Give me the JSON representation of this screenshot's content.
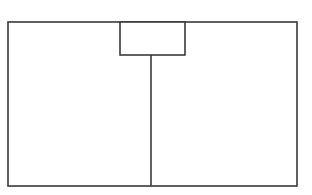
{
  "diagram": {
    "type": "floor-plan-outline",
    "canvas": {
      "width": 312,
      "height": 195,
      "background": "#ffffff"
    },
    "stroke": {
      "color": "#3a3a3a",
      "width": 1.6
    },
    "outer_rect": {
      "x": 8,
      "y": 22,
      "width": 289,
      "height": 164
    },
    "top_box": {
      "x": 120,
      "y": 22,
      "width": 65,
      "height": 33
    },
    "divider": {
      "x": 151,
      "y1": 55,
      "y2": 186
    },
    "regions": [
      {
        "name": "left-panel",
        "label": ""
      },
      {
        "name": "right-panel",
        "label": ""
      },
      {
        "name": "top-box",
        "label": ""
      }
    ]
  }
}
